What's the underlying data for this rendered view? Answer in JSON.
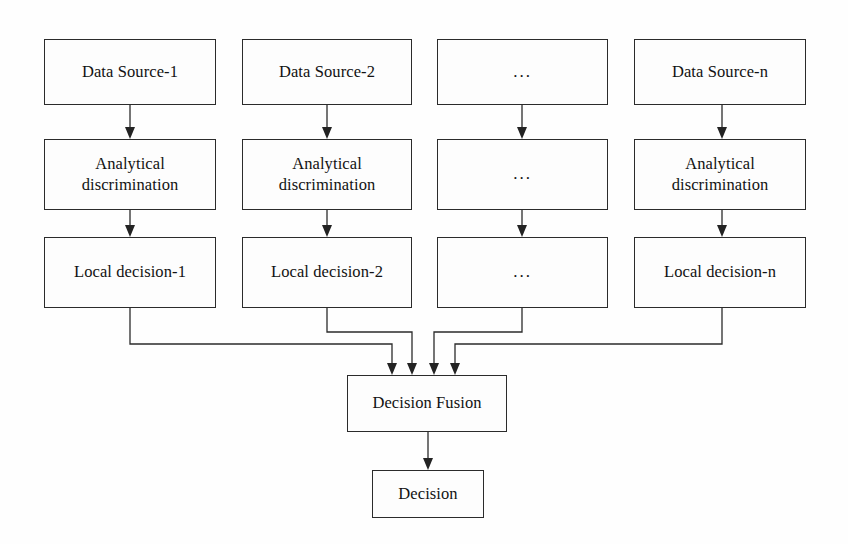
{
  "diagram": {
    "background_color": "#fefefe",
    "line_color": "#2b2b2b",
    "text_color": "#121212",
    "columns": [
      {
        "id": "column-1",
        "source": "Data Source-1",
        "process_line1": "Analytical",
        "process_line2": "discrimination",
        "decision": "Local decision-1"
      },
      {
        "id": "column-2",
        "source": "Data Source-2",
        "process_line1": "Analytical",
        "process_line2": "discrimination",
        "decision": "Local decision-2"
      },
      {
        "id": "column-ellipsis",
        "source": "...",
        "process_line1": "...",
        "process_line2": "",
        "decision": "..."
      },
      {
        "id": "column-n",
        "source": "Data Source-n",
        "process_line1": "Analytical",
        "process_line2": "discrimination",
        "decision": "Local decision-n"
      }
    ],
    "fusion": {
      "label": "Decision Fusion"
    },
    "output": {
      "label": "Decision"
    }
  }
}
